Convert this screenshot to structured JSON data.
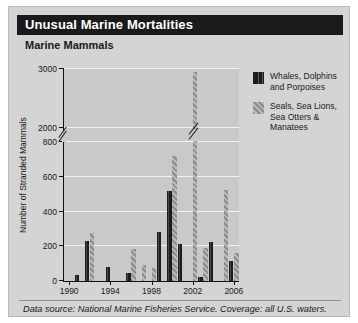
{
  "header": {
    "title": "Unusual Marine Mortalities",
    "subtitle": "Marine Mammals"
  },
  "legend": {
    "items": [
      {
        "label": "Whales, Dolphins and Porpoises",
        "swatch": "vertical-stripe-dark",
        "color": "#1c1c1c"
      },
      {
        "label": "Seals, Sea Lions, Sea Otters & Manatees",
        "swatch": "diagonal-hatch-gray",
        "color": "#9a9a9a"
      }
    ]
  },
  "footnote": "Data source: National Marine Fisheries Service. Coverage: all U.S. waters.",
  "chart_data": {
    "type": "bar",
    "title": "Marine Mammals",
    "xlabel": "",
    "ylabel": "Number of Stranded Mammals",
    "grid": true,
    "legend_position": "right",
    "axis_break": {
      "from": 800,
      "to": 2000
    },
    "ylim": [
      0,
      3000
    ],
    "ytick_labels": [
      "0",
      "200",
      "400",
      "600",
      "800",
      "2000",
      "3000"
    ],
    "yticks": [
      0,
      200,
      400,
      600,
      800,
      2000,
      3000
    ],
    "xtick_labels": [
      "1990",
      "1994",
      "1998",
      "2002",
      "2006"
    ],
    "xticks": [
      1990,
      1994,
      1998,
      2002,
      2006
    ],
    "categories": [
      1990,
      1991,
      1992,
      1993,
      1994,
      1995,
      1996,
      1997,
      1998,
      1999,
      2000,
      2001,
      2002,
      2003,
      2004,
      2005,
      2006
    ],
    "series": [
      {
        "name": "Whales, Dolphins and Porpoises",
        "color": "#1c1c1c",
        "values": [
          0,
          35,
          230,
          0,
          80,
          0,
          45,
          0,
          0,
          285,
          520,
          215,
          0,
          25,
          225,
          0,
          115
        ]
      },
      {
        "name": "Seals, Sea Lions, Sea Otters & Manatees",
        "color": "#9a9a9a",
        "values": [
          0,
          0,
          275,
          0,
          0,
          0,
          185,
          95,
          75,
          0,
          720,
          0,
          2950,
          190,
          0,
          525,
          160
        ]
      }
    ]
  }
}
